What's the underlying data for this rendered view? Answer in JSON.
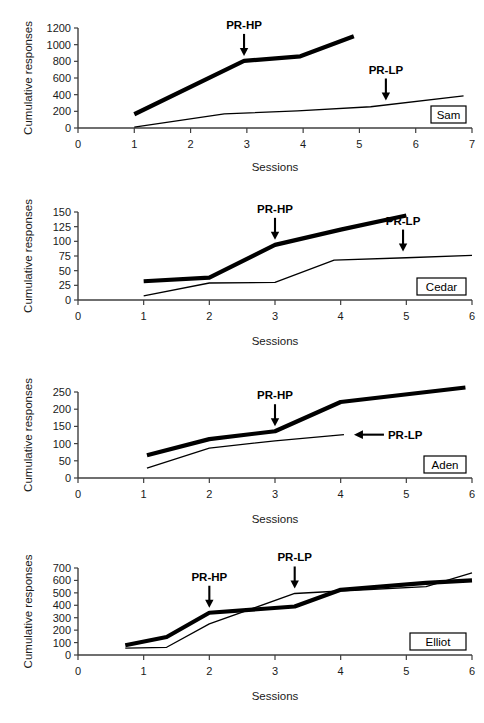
{
  "figure": {
    "background_color": "#ffffff",
    "line_color": "#000000",
    "axis_color": "#3f3f3f",
    "panel_count": 4
  },
  "chart_data": [
    {
      "type": "line",
      "title": "",
      "subject": "Sam",
      "xlabel": "Sessions",
      "ylabel": "Cumulative responses",
      "xlim": [
        0,
        7
      ],
      "ylim": [
        0,
        1200
      ],
      "xticks": [
        0,
        1,
        2,
        3,
        4,
        5,
        6,
        7
      ],
      "yticks": [
        0,
        200,
        400,
        600,
        800,
        1000,
        1200
      ],
      "xticklabels": [
        "0",
        "1",
        "2",
        "3",
        "4",
        "5",
        "6",
        "7"
      ],
      "yticklabels": [
        "0",
        "200",
        "400",
        "600",
        "800",
        "1000",
        "1200"
      ],
      "grid": false,
      "legend": "none",
      "series": [
        {
          "name": "high-preference",
          "style": "thick",
          "x": [
            1.0,
            2.95,
            3.95,
            4.9
          ],
          "values": [
            165,
            805,
            860,
            1100
          ]
        },
        {
          "name": "low-preference",
          "style": "thin",
          "x": [
            1.0,
            2.6,
            3.9,
            5.2,
            6.85
          ],
          "values": [
            10,
            170,
            205,
            255,
            385
          ]
        }
      ],
      "annotations": [
        {
          "label": "PR-HP",
          "x": 2.95,
          "y": 805,
          "arrow": "down"
        },
        {
          "label": "PR-LP",
          "x": 5.47,
          "y": 270,
          "arrow": "down"
        }
      ]
    },
    {
      "type": "line",
      "title": "",
      "subject": "Cedar",
      "xlabel": "Sessions",
      "ylabel": "Cumulative responses",
      "xlim": [
        0,
        6
      ],
      "ylim": [
        0,
        150
      ],
      "xticks": [
        0,
        1,
        2,
        3,
        4,
        5,
        6
      ],
      "yticks": [
        0,
        25,
        50,
        75,
        100,
        125,
        150
      ],
      "xticklabels": [
        "0",
        "1",
        "2",
        "3",
        "4",
        "5",
        "6"
      ],
      "yticklabels": [
        "0",
        "25",
        "50",
        "75",
        "100",
        "125",
        "150"
      ],
      "grid": false,
      "legend": "none",
      "series": [
        {
          "name": "high-preference",
          "style": "thick",
          "x": [
            1.0,
            2.0,
            3.0,
            4.0,
            5.0
          ],
          "values": [
            32,
            38,
            94,
            120,
            144
          ]
        },
        {
          "name": "low-preference",
          "style": "thin",
          "x": [
            1.0,
            2.0,
            3.0,
            3.9,
            5.0,
            6.0
          ],
          "values": [
            7,
            29,
            30,
            68,
            72,
            76
          ]
        }
      ],
      "annotations": [
        {
          "label": "PR-HP",
          "x": 3.0,
          "y": 94,
          "arrow": "down"
        },
        {
          "label": "PR-LP",
          "x": 4.95,
          "y": 74,
          "arrow": "down"
        }
      ]
    },
    {
      "type": "line",
      "title": "",
      "subject": "Aden",
      "xlabel": "Sessions",
      "ylabel": "Cumulative responses",
      "xlim": [
        0,
        6
      ],
      "ylim": [
        0,
        250
      ],
      "xticks": [
        0,
        1,
        2,
        3,
        4,
        5,
        6
      ],
      "yticks": [
        0,
        50,
        100,
        150,
        200,
        250
      ],
      "xticklabels": [
        "0",
        "1",
        "2",
        "3",
        "4",
        "5",
        "6"
      ],
      "yticklabels": [
        "0",
        "50",
        "100",
        "150",
        "200",
        "250"
      ],
      "grid": false,
      "legend": "none",
      "series": [
        {
          "name": "high-preference",
          "style": "thick",
          "x": [
            1.05,
            2.0,
            3.0,
            4.0,
            5.9
          ],
          "values": [
            66,
            113,
            136,
            221,
            263
          ]
        },
        {
          "name": "low-preference",
          "style": "thin",
          "x": [
            1.05,
            2.0,
            3.0,
            4.05
          ],
          "values": [
            29,
            87,
            108,
            126
          ]
        }
      ],
      "annotations": [
        {
          "label": "PR-HP",
          "x": 3.0,
          "y": 136,
          "arrow": "down"
        },
        {
          "label": "PR-LP",
          "x": 4.05,
          "y": 126,
          "arrow": "left"
        }
      ]
    },
    {
      "type": "line",
      "title": "",
      "subject": "Elliot",
      "xlabel": "Sessions",
      "ylabel": "Cumulative responses",
      "xlim": [
        0,
        6
      ],
      "ylim": [
        0,
        700
      ],
      "xticks": [
        0,
        1,
        2,
        3,
        4,
        5,
        6
      ],
      "yticks": [
        0,
        100,
        200,
        300,
        400,
        500,
        600,
        700
      ],
      "xticklabels": [
        "0",
        "1",
        "2",
        "3",
        "4",
        "5",
        "6"
      ],
      "yticklabels": [
        "0",
        "100",
        "200",
        "300",
        "400",
        "500",
        "600",
        "700"
      ],
      "grid": false,
      "legend": "none",
      "series": [
        {
          "name": "high-preference",
          "style": "thick",
          "x": [
            0.72,
            1.35,
            2.0,
            3.3,
            4.0,
            5.3,
            6.0
          ],
          "values": [
            78,
            145,
            340,
            390,
            525,
            580,
            600
          ]
        },
        {
          "name": "low-preference",
          "style": "thin",
          "x": [
            0.72,
            1.35,
            2.0,
            3.3,
            4.0,
            5.3,
            6.0
          ],
          "values": [
            55,
            62,
            250,
            495,
            515,
            550,
            660
          ]
        }
      ],
      "annotations": [
        {
          "label": "PR-HP",
          "x": 2.0,
          "y": 340,
          "arrow": "down"
        },
        {
          "label": "PR-LP",
          "x": 3.3,
          "y": 495,
          "arrow": "down"
        }
      ]
    }
  ]
}
